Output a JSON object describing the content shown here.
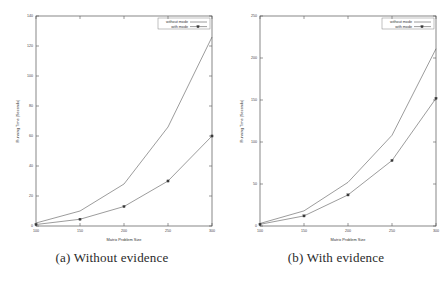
{
  "figure": {
    "panels": [
      {
        "caption": "(a) Without evidence",
        "caption_tag": "(a)"
      },
      {
        "caption": "(b) With evidence",
        "caption_tag": "(b)"
      }
    ]
  },
  "chart_data": [
    {
      "type": "line",
      "title": "",
      "xlabel": "Matrix Problem Size",
      "ylabel": "Running Time (Seconds)",
      "x": [
        100,
        150,
        200,
        250,
        300
      ],
      "xticklabels": [
        "100",
        "150",
        "200",
        "250",
        "300"
      ],
      "yticklabels": [
        "0",
        "20",
        "40",
        "60",
        "80",
        "100",
        "120",
        "140"
      ],
      "yticks": [
        0,
        20,
        40,
        60,
        80,
        100,
        120,
        140
      ],
      "xlim": [
        100,
        300
      ],
      "ylim": [
        0,
        140
      ],
      "grid": false,
      "legend_position": "top-right",
      "series": [
        {
          "name": "without mode",
          "values": [
            2,
            10,
            28,
            66,
            126
          ]
        },
        {
          "name": "with mode",
          "values": [
            1,
            4.5,
            13,
            30,
            60
          ]
        }
      ]
    },
    {
      "type": "line",
      "title": "",
      "xlabel": "Matrix Problem Size",
      "ylabel": "Running Time (Seconds)",
      "x": [
        100,
        150,
        200,
        250,
        300
      ],
      "xticklabels": [
        "100",
        "150",
        "200",
        "250",
        "300"
      ],
      "yticklabels": [
        "0",
        "50",
        "100",
        "150",
        "200",
        "250"
      ],
      "yticks": [
        0,
        50,
        100,
        150,
        200,
        250
      ],
      "xlim": [
        100,
        300
      ],
      "ylim": [
        0,
        250
      ],
      "grid": false,
      "legend_position": "top-right",
      "series": [
        {
          "name": "without mode",
          "values": [
            3,
            18,
            52,
            108,
            211
          ]
        },
        {
          "name": "with mode",
          "values": [
            2,
            12,
            37,
            78,
            152
          ]
        }
      ]
    }
  ]
}
